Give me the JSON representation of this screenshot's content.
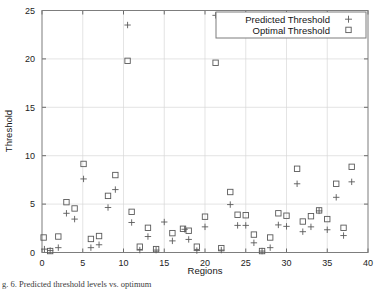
{
  "figure": {
    "caption": "g. 6. Predicted threshold levels vs. optimum",
    "background": "#ffffff"
  },
  "chart_data": {
    "type": "scatter",
    "title": "",
    "xlabel": "Regions",
    "ylabel": "Threshold",
    "xlim": [
      0,
      40
    ],
    "ylim": [
      0,
      25
    ],
    "xticks": [
      0,
      5,
      10,
      15,
      20,
      25,
      30,
      35,
      40
    ],
    "yticks": [
      0,
      5,
      10,
      15,
      20,
      25
    ],
    "grid": true,
    "legend_position": "top-right",
    "marker_color": "#5a5a5a",
    "series": [
      {
        "name": "Predicted Threshold",
        "marker": "plus",
        "points": [
          [
            0.3,
            0.35
          ],
          [
            1.0,
            0.2
          ],
          [
            2.0,
            0.5
          ],
          [
            3.0,
            4.05
          ],
          [
            4.0,
            3.45
          ],
          [
            5.1,
            7.6
          ],
          [
            6.0,
            0.5
          ],
          [
            7.0,
            0.8
          ],
          [
            8.1,
            4.65
          ],
          [
            9.0,
            6.5
          ],
          [
            10.5,
            23.5
          ],
          [
            11.0,
            3.1
          ],
          [
            12.0,
            0.25
          ],
          [
            13.0,
            1.65
          ],
          [
            14.0,
            0.25
          ],
          [
            15.0,
            3.15
          ],
          [
            16.0,
            1.2
          ],
          [
            17.5,
            2.4
          ],
          [
            18.0,
            1.35
          ],
          [
            19.0,
            0.2
          ],
          [
            20.0,
            2.65
          ],
          [
            21.3,
            24.5
          ],
          [
            22.0,
            0.25
          ],
          [
            23.1,
            4.95
          ],
          [
            24.0,
            2.8
          ],
          [
            25.0,
            2.8
          ],
          [
            26.0,
            1.0
          ],
          [
            27.0,
            0.15
          ],
          [
            28.0,
            0.5
          ],
          [
            29.0,
            2.85
          ],
          [
            30.0,
            2.7
          ],
          [
            31.3,
            7.1
          ],
          [
            32.0,
            2.15
          ],
          [
            33.0,
            2.65
          ],
          [
            34.0,
            4.3
          ],
          [
            35.0,
            2.35
          ],
          [
            36.1,
            5.7
          ],
          [
            37.0,
            1.75
          ],
          [
            38.0,
            7.3
          ]
        ]
      },
      {
        "name": "Optimal Threshold",
        "marker": "square",
        "points": [
          [
            0.2,
            1.55
          ],
          [
            1.0,
            0.15
          ],
          [
            2.0,
            1.65
          ],
          [
            3.0,
            5.2
          ],
          [
            4.0,
            4.55
          ],
          [
            5.1,
            9.15
          ],
          [
            6.0,
            1.4
          ],
          [
            7.0,
            1.7
          ],
          [
            8.1,
            5.85
          ],
          [
            9.0,
            8.0
          ],
          [
            10.5,
            19.8
          ],
          [
            11.0,
            4.2
          ],
          [
            12.0,
            0.6
          ],
          [
            13.0,
            2.55
          ],
          [
            14.0,
            0.35
          ],
          [
            16.0,
            2.0
          ],
          [
            17.3,
            2.45
          ],
          [
            18.0,
            2.25
          ],
          [
            19.0,
            0.6
          ],
          [
            20.0,
            3.7
          ],
          [
            21.3,
            19.6
          ],
          [
            22.0,
            0.45
          ],
          [
            23.1,
            6.25
          ],
          [
            24.0,
            3.9
          ],
          [
            25.0,
            3.85
          ],
          [
            26.0,
            1.85
          ],
          [
            27.0,
            0.15
          ],
          [
            28.0,
            1.55
          ],
          [
            29.0,
            4.05
          ],
          [
            30.0,
            3.8
          ],
          [
            31.3,
            8.65
          ],
          [
            32.0,
            3.2
          ],
          [
            33.0,
            3.75
          ],
          [
            34.0,
            4.35
          ],
          [
            35.0,
            3.45
          ],
          [
            36.1,
            7.1
          ],
          [
            37.0,
            2.55
          ],
          [
            38.0,
            8.85
          ]
        ]
      }
    ]
  },
  "legend": {
    "entries": [
      {
        "label": "Predicted Threshold",
        "marker": "plus"
      },
      {
        "label": "Optimal Threshold",
        "marker": "square"
      }
    ]
  }
}
